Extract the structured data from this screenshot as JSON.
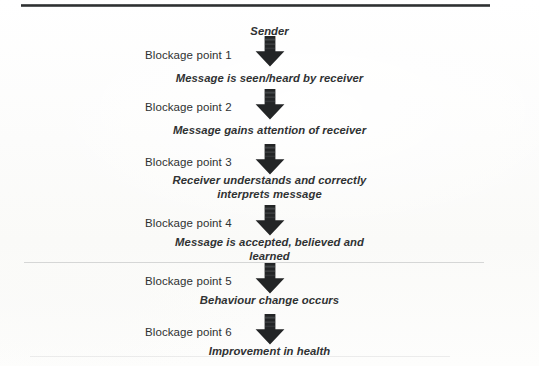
{
  "document": {
    "type": "flowchart-diagram",
    "title_text": "Sender",
    "ink_color": "#303233",
    "rule_color": "#2c2e2f",
    "background": "#fdfdfc"
  },
  "flow": {
    "start_label": "Sender",
    "arrow_icon": "down-block-arrow-icon",
    "steps": [
      {
        "blockage": "Blockage point 1",
        "message_lines": [
          "Message is seen/heard by receiver"
        ]
      },
      {
        "blockage": "Blockage point 2",
        "message_lines": [
          "Message gains attention of receiver"
        ]
      },
      {
        "blockage": "Blockage point 3",
        "message_lines": [
          "Receiver understands and correctly",
          "interprets message"
        ]
      },
      {
        "blockage": "Blockage point 4",
        "message_lines": [
          "Message is accepted, believed and",
          "learned"
        ]
      },
      {
        "blockage": "Blockage point 5",
        "message_lines": [
          "Behaviour change occurs"
        ]
      },
      {
        "blockage": "Blockage point 6",
        "message_lines": [
          "Improvement in health"
        ]
      }
    ]
  }
}
